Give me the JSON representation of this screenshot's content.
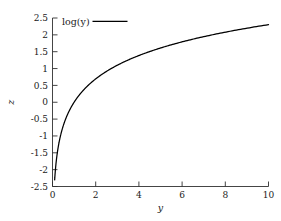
{
  "chart_data": {
    "type": "line",
    "title": "",
    "subtitle": "",
    "xlabel": "y",
    "ylabel": "z",
    "xlim": [
      0,
      10
    ],
    "ylim": [
      -2.5,
      2.5
    ],
    "grid": false,
    "legend_position": "top-left-inside",
    "x_ticks": [
      "0",
      "2",
      "4",
      "6",
      "8",
      "10"
    ],
    "x_tick_values": [
      0,
      2,
      4,
      6,
      8,
      10
    ],
    "y_ticks": [
      "2.5",
      "2",
      "1.5",
      "1",
      "0.5",
      "0",
      "-0.5",
      "-1",
      "-1.5",
      "-2",
      "-2.5"
    ],
    "y_tick_values": [
      2.5,
      2,
      1.5,
      1,
      0.5,
      0,
      -0.5,
      -1,
      -1.5,
      -2,
      -2.5
    ],
    "series": [
      {
        "name": "log(y)",
        "color": "#000000",
        "x": [
          0.1,
          0.15,
          0.2,
          0.25,
          0.3,
          0.4,
          0.5,
          0.6,
          0.7,
          0.8,
          0.9,
          1.0,
          1.2,
          1.4,
          1.6,
          1.8,
          2.0,
          2.4,
          2.8,
          3.2,
          3.6,
          4.0,
          4.5,
          5.0,
          5.5,
          6.0,
          6.5,
          7.0,
          7.5,
          8.0,
          8.5,
          9.0,
          9.5,
          10.0
        ],
        "values": [
          -2.303,
          -1.897,
          -1.609,
          -1.386,
          -1.204,
          -0.916,
          -0.693,
          -0.511,
          -0.357,
          -0.223,
          -0.105,
          0.0,
          0.182,
          0.336,
          0.47,
          0.588,
          0.693,
          0.875,
          1.03,
          1.163,
          1.281,
          1.386,
          1.504,
          1.609,
          1.705,
          1.792,
          1.872,
          1.946,
          2.015,
          2.079,
          2.14,
          2.197,
          2.251,
          2.303
        ]
      }
    ]
  },
  "legend": {
    "entries": [
      {
        "label": "log(y)"
      }
    ]
  },
  "axes": {
    "x_title": "y",
    "y_title": "z"
  }
}
